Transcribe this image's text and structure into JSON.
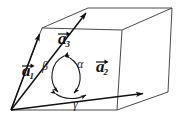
{
  "figure": {
    "background_color": "#ffffff",
    "line_color": "#1a1a1a",
    "thin_line_color": "#555555",
    "width": 187,
    "height": 124
  },
  "vectors": [
    {
      "id": "a1",
      "base": "a",
      "subscript": "1",
      "label_x": 22,
      "label_y": 62,
      "tip": [
        42,
        28
      ],
      "origin": [
        11,
        110
      ]
    },
    {
      "id": "a2",
      "base": "a",
      "subscript": "2",
      "label_x": 96,
      "label_y": 58,
      "tip": [
        148,
        93
      ],
      "origin": [
        11,
        110
      ]
    },
    {
      "id": "a3",
      "base": "a",
      "subscript": "3",
      "label_x": 58,
      "label_y": 30,
      "tip": [
        88,
        8
      ],
      "origin": [
        11,
        110
      ]
    }
  ],
  "angles": [
    {
      "id": "alpha",
      "symbol": "α",
      "label_x": 77,
      "label_y": 58
    },
    {
      "id": "beta",
      "symbol": "β",
      "label_x": 42,
      "label_y": 60
    },
    {
      "id": "gamma",
      "symbol": "γ",
      "label_x": 73,
      "label_y": 98
    }
  ],
  "geometry": {
    "origin": [
      11,
      110
    ],
    "bottom_front": [
      117,
      110
    ],
    "bottom_right": [
      168,
      92
    ],
    "top_left": [
      42,
      28
    ],
    "top_mid": [
      88,
      8
    ],
    "top_right": [
      172,
      8
    ],
    "mid_right": [
      122,
      30
    ]
  }
}
